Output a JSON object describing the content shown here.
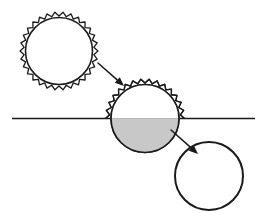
{
  "figure": {
    "canvas": {
      "width": 261,
      "height": 213
    },
    "background_color": "#ffffff"
  },
  "style": {
    "outline_color": "#1a1a1a",
    "fill_gray": "#c8c8c8",
    "fill_white": "#ffffff",
    "line_width_circle": 1.6,
    "line_width_interface": 1.6,
    "arrow_color": "#1a1a1a"
  },
  "interface_line": {
    "label": "interface-line",
    "y": 118.5,
    "x_start": 12,
    "x_end": 255,
    "color": "#1a1a1a"
  },
  "shapes": [
    {
      "id": "particle-1",
      "label": "spiky-particle-unwetted",
      "state": "coated, above interface, unfilled",
      "center_x": 59,
      "center_y": 51,
      "inner_radius": 33.5,
      "outer_radius": 39,
      "teeth": 30,
      "fill": "#ffffff",
      "has_serration": true,
      "serration_span": "full"
    },
    {
      "id": "particle-2",
      "label": "spiky-particle-half-submerged",
      "state": "coated above interface, shaded below interface",
      "center_x": 145,
      "center_y": 118.5,
      "inner_radius": 34,
      "outer_radius": 39.5,
      "teeth": 30,
      "fill_upper": "#ffffff",
      "fill_lower": "#c8c8c8",
      "has_serration": true,
      "serration_span": "upper-half-only"
    },
    {
      "id": "particle-3",
      "label": "smooth-particle-wetted",
      "state": "uncoated, fully shaded, below interface",
      "center_x": 209,
      "center_y": 176,
      "inner_radius": 34,
      "outer_radius": 34,
      "teeth": 0,
      "fill": "#c8c8c8",
      "has_serration": false,
      "serration_span": "none"
    }
  ],
  "arrows": [
    {
      "id": "arrow-1",
      "label": "transition-arrow-one-to-two",
      "from_x": 98,
      "from_y": 63,
      "to_x": 124,
      "to_y": 86,
      "head_size": 9,
      "color": "#1a1a1a"
    },
    {
      "id": "arrow-2",
      "label": "transition-arrow-two-to-three",
      "from_x": 171,
      "from_y": 130,
      "to_x": 198,
      "to_y": 154,
      "head_size": 9,
      "color": "#1a1a1a"
    }
  ]
}
